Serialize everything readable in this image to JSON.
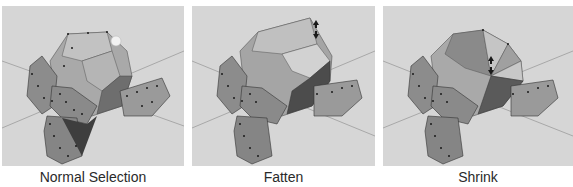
{
  "panels": [
    {
      "id": "normal-selection",
      "caption": "Normal Selection",
      "handle": "circle"
    },
    {
      "id": "fatten",
      "caption": "Fatten",
      "handle": "arrows"
    },
    {
      "id": "shrink",
      "caption": "Shrink",
      "handle": "arrows"
    }
  ],
  "colors": {
    "viewport_bg": "#d6d6d6",
    "grid_line": "#a8a8a8",
    "mesh_light": "#bcbcbc",
    "mesh_mid": "#9a9a9a",
    "mesh_dark": "#4a4a4a",
    "vertex": "#1a1a1a"
  }
}
